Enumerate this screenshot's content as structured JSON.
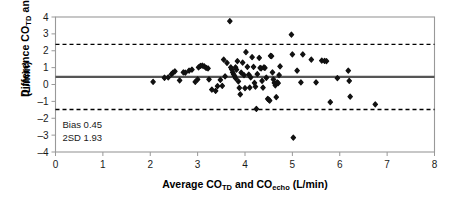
{
  "chart_data": {
    "type": "scatter",
    "title": "",
    "xlabel": "Average CO_TD and CO_echo (L/min)",
    "ylabel": "Difference CO_TD and CO_echo (L/min)",
    "xlim": [
      0,
      8
    ],
    "ylim": [
      -4,
      4
    ],
    "xticks": [
      0,
      1,
      2,
      3,
      4,
      5,
      6,
      7,
      8
    ],
    "yticks": [
      -4,
      -3,
      -2,
      -1,
      0,
      1,
      2,
      3,
      4
    ],
    "grid": false,
    "legend": "none",
    "bias": 0.45,
    "two_sd": 1.93,
    "upper_limit": 2.38,
    "lower_limit": -1.48,
    "reference_lines": [
      {
        "name": "bias-line",
        "y": 0.45,
        "style": "solid"
      },
      {
        "name": "upper-limit-line",
        "y": 2.38,
        "style": "dashed"
      },
      {
        "name": "lower-limit-line",
        "y": -1.48,
        "style": "dashed"
      }
    ],
    "points": [
      [
        2.06,
        0.16
      ],
      [
        2.3,
        0.4
      ],
      [
        2.38,
        0.42
      ],
      [
        2.45,
        0.62
      ],
      [
        2.48,
        0.7
      ],
      [
        2.52,
        0.78
      ],
      [
        2.62,
        0.24
      ],
      [
        2.7,
        0.72
      ],
      [
        2.74,
        0.7
      ],
      [
        2.82,
        0.82
      ],
      [
        2.88,
        0.88
      ],
      [
        2.95,
        0.16
      ],
      [
        3.0,
        0.3
      ],
      [
        3.02,
        1.02
      ],
      [
        3.06,
        1.1
      ],
      [
        3.1,
        1.12
      ],
      [
        3.14,
        1.08
      ],
      [
        3.18,
        0.98
      ],
      [
        3.22,
        0.95
      ],
      [
        3.24,
        0.3
      ],
      [
        3.3,
        -0.3
      ],
      [
        3.38,
        -0.38
      ],
      [
        3.42,
        -0.1
      ],
      [
        3.48,
        0.28
      ],
      [
        3.52,
        -0.08
      ],
      [
        3.55,
        1.48
      ],
      [
        3.58,
        0.48
      ],
      [
        3.62,
        1.28
      ],
      [
        3.68,
        3.75
      ],
      [
        3.7,
        1.02
      ],
      [
        3.72,
        0.9
      ],
      [
        3.74,
        0.72
      ],
      [
        3.76,
        0.6
      ],
      [
        3.78,
        0.5
      ],
      [
        3.8,
        0.38
      ],
      [
        3.8,
        1.02
      ],
      [
        3.82,
        0.88
      ],
      [
        3.84,
        1.38
      ],
      [
        3.86,
        0.18
      ],
      [
        3.88,
        -0.2
      ],
      [
        3.9,
        -0.58
      ],
      [
        3.92,
        0.7
      ],
      [
        3.95,
        1.3
      ],
      [
        3.98,
        0.55
      ],
      [
        4.0,
        -0.22
      ],
      [
        4.02,
        1.92
      ],
      [
        4.05,
        1.05
      ],
      [
        4.08,
        0.58
      ],
      [
        4.1,
        -0.18
      ],
      [
        4.12,
        0.42
      ],
      [
        4.15,
        1.62
      ],
      [
        4.18,
        1.05
      ],
      [
        4.2,
        0.1
      ],
      [
        4.22,
        -0.12
      ],
      [
        4.24,
        -1.45
      ],
      [
        4.26,
        0.62
      ],
      [
        4.3,
        1.58
      ],
      [
        4.32,
        0.98
      ],
      [
        4.34,
        0.95
      ],
      [
        4.36,
        0.22
      ],
      [
        4.38,
        -0.18
      ],
      [
        4.4,
        1.02
      ],
      [
        4.42,
        0.98
      ],
      [
        4.45,
        0.4
      ],
      [
        4.48,
        -0.85
      ],
      [
        4.5,
        -0.9
      ],
      [
        4.52,
        -0.95
      ],
      [
        4.54,
        1.7
      ],
      [
        4.56,
        1.68
      ],
      [
        4.58,
        0.72
      ],
      [
        4.6,
        0.3
      ],
      [
        4.62,
        0.1
      ],
      [
        4.64,
        -0.05
      ],
      [
        4.66,
        -0.75
      ],
      [
        4.68,
        0.12
      ],
      [
        4.7,
        0.08
      ],
      [
        4.72,
        0.55
      ],
      [
        4.74,
        1.08
      ],
      [
        4.98,
        2.95
      ],
      [
        5.0,
        1.78
      ],
      [
        5.02,
        -3.15
      ],
      [
        5.1,
        0.82
      ],
      [
        5.18,
        0.12
      ],
      [
        5.22,
        1.78
      ],
      [
        5.4,
        1.48
      ],
      [
        5.5,
        0.12
      ],
      [
        5.62,
        1.42
      ],
      [
        5.68,
        1.4
      ],
      [
        5.72,
        1.38
      ],
      [
        5.8,
        -1.05
      ],
      [
        5.95,
        0.38
      ],
      [
        6.18,
        0.82
      ],
      [
        6.2,
        0.22
      ],
      [
        6.22,
        -0.72
      ],
      [
        6.75,
        -1.18
      ]
    ]
  },
  "annotations": [
    {
      "name": "bias-annotation",
      "text": "Bias 0.45"
    },
    {
      "name": "sd-annotation",
      "text": "2SD 1.93"
    }
  ],
  "axis_labels": {
    "y_part1": "Difference CO",
    "y_sub1": "TD",
    "y_part2": " and CO",
    "y_sub2": "echo",
    "y_units": "(L/min)",
    "x_part1": "Average CO",
    "x_sub1": "TD",
    "x_part2": " and CO",
    "x_sub2": "echo",
    "x_part3": " (L/min)"
  },
  "colors": {
    "point": "#111111",
    "bias_line": "#555555",
    "limit_line": "#000000",
    "axis": "#999999",
    "text": "#1a1a1a"
  }
}
